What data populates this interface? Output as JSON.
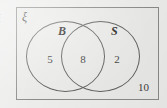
{
  "diagram": {
    "type": "venn-two-set",
    "universal_set_symbol": "ξ",
    "edge_artifact_glyph": "ξ",
    "sets": [
      {
        "key": "B",
        "label": "B",
        "exclusive_count": "5"
      },
      {
        "key": "S",
        "label": "S",
        "exclusive_count": "2"
      }
    ],
    "intersection_count": "8",
    "outside_count": "10",
    "colors": {
      "page_background": "#ececeb",
      "rect_fill": "#e9e9e7",
      "rect_border": "#8a8a88",
      "circle_border": "#5d5d5b",
      "text": "#3c3c3a",
      "label_text": "#232321"
    }
  }
}
